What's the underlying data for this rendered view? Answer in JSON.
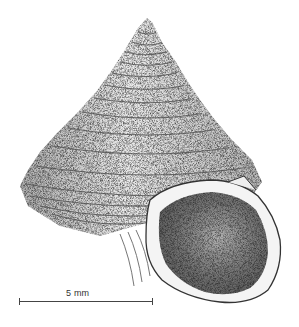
{
  "figure": {
    "style": "stippled pen-and-ink drawing"
  },
  "scale_bar": {
    "label": "5 mm",
    "length_px": 134
  },
  "colors": {
    "background": "#ffffff",
    "ink": "#333333"
  }
}
